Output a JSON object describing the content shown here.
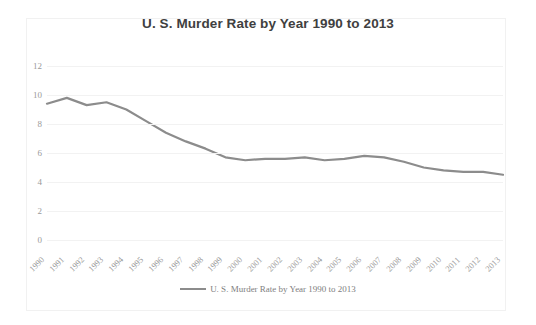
{
  "chart_data": {
    "type": "line",
    "title": "U. S. Murder Rate by Year 1990 to 2013",
    "xlabel": "",
    "ylabel": "",
    "ylim": [
      0,
      12
    ],
    "yticks": [
      0,
      2,
      4,
      6,
      8,
      10,
      12
    ],
    "grid": true,
    "legend_position": "bottom",
    "legend": [
      "U. S. Murder Rate by Year 1990 to 2013"
    ],
    "series_color": "#8c8c8c",
    "categories": [
      "1990",
      "1991",
      "1992",
      "1993",
      "1994",
      "1995",
      "1996",
      "1997",
      "1998",
      "1999",
      "2000",
      "2001",
      "2002",
      "2003",
      "2004",
      "2005",
      "2006",
      "2007",
      "2008",
      "2009",
      "2010",
      "2011",
      "2012",
      "2013"
    ],
    "series": [
      {
        "name": "U. S. Murder Rate by Year 1990 to 2013",
        "values": [
          9.4,
          9.8,
          9.3,
          9.5,
          9.0,
          8.2,
          7.4,
          6.8,
          6.3,
          5.7,
          5.5,
          5.6,
          5.6,
          5.7,
          5.5,
          5.6,
          5.8,
          5.7,
          5.4,
          5.0,
          4.8,
          4.7,
          4.7,
          4.5
        ]
      }
    ]
  },
  "chart": {
    "title": "U. S. Murder Rate by Year 1990 to 2013",
    "legend_label": "U. S. Murder Rate by Year 1990 to 2013"
  }
}
